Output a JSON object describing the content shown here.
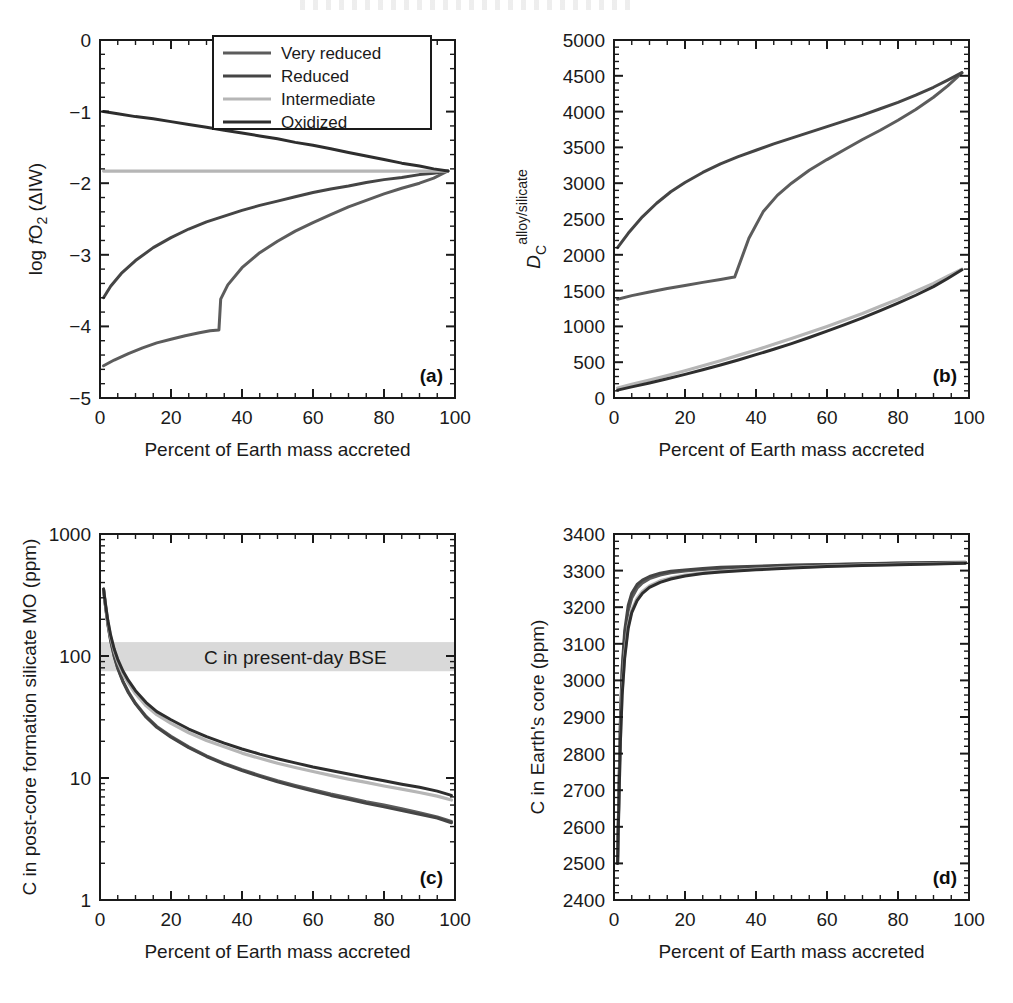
{
  "figure": {
    "panels": [
      "a",
      "b",
      "c",
      "d"
    ],
    "xlabel": "Percent of Earth mass accreted",
    "label_a": "(a)",
    "label_b": "(b)",
    "label_c": "(c)",
    "label_d": "(d)"
  },
  "legend": {
    "position": "top-right of panel a",
    "items": [
      {
        "label": "Very reduced",
        "color": "#5c5c5c"
      },
      {
        "label": "Reduced",
        "color": "#454545"
      },
      {
        "label": "Intermediate",
        "color": "#b6b6b6"
      },
      {
        "label": "Oxidized",
        "color": "#2e2e2e"
      }
    ]
  },
  "annotations": {
    "bse_band_label": "C in present-day BSE",
    "bse_band_color": "#d9d9d9",
    "bse_band_range": [
      75,
      130
    ]
  },
  "colors": {
    "very_reduced": "#5c5c5c",
    "reduced": "#454545",
    "intermediate": "#b6b6b6",
    "oxidized": "#2e2e2e",
    "axis": "#1a1a1a",
    "band": "#d9d9d9"
  },
  "chart_data": [
    {
      "id": "a",
      "type": "line",
      "title": "",
      "panel_label": "(a)",
      "xlabel": "Percent of Earth mass accreted",
      "ylabel": "log fO2 (ΔIW)",
      "ylabel_parts": {
        "pre": "log ",
        "italic": "f",
        "base": "O",
        "sub": "2",
        "post": " (ΔIW)"
      },
      "xlim": [
        0,
        100
      ],
      "ylim": [
        -5,
        0
      ],
      "xticks": [
        0,
        20,
        40,
        60,
        80,
        100
      ],
      "yticks": [
        0,
        -1,
        -2,
        -3,
        -4,
        -5
      ],
      "ytick_labels": [
        "0",
        "−1",
        "−2",
        "−3",
        "−4",
        "−5"
      ],
      "x_minor_step": 5,
      "y_minor_step": 0.2,
      "grid": false,
      "legend_position": "upper right",
      "series": [
        {
          "name": "Very reduced",
          "color": "#5c5c5c",
          "x": [
            1,
            4,
            8,
            12,
            16,
            20,
            24,
            28,
            31,
            33.5,
            34,
            36,
            40,
            45,
            50,
            55,
            60,
            65,
            70,
            75,
            80,
            85,
            90,
            94,
            98
          ],
          "y": [
            -4.55,
            -4.47,
            -4.38,
            -4.3,
            -4.23,
            -4.18,
            -4.13,
            -4.09,
            -4.06,
            -4.05,
            -3.62,
            -3.42,
            -3.18,
            -2.97,
            -2.81,
            -2.67,
            -2.55,
            -2.44,
            -2.33,
            -2.24,
            -2.15,
            -2.07,
            -2.0,
            -1.93,
            -1.83
          ]
        },
        {
          "name": "Reduced",
          "color": "#454545",
          "x": [
            1,
            3,
            6,
            10,
            15,
            20,
            25,
            30,
            35,
            40,
            45,
            50,
            55,
            60,
            65,
            70,
            75,
            80,
            85,
            90,
            94,
            98
          ],
          "y": [
            -3.6,
            -3.44,
            -3.26,
            -3.08,
            -2.9,
            -2.76,
            -2.64,
            -2.54,
            -2.46,
            -2.38,
            -2.31,
            -2.25,
            -2.19,
            -2.13,
            -2.08,
            -2.04,
            -1.99,
            -1.95,
            -1.92,
            -1.88,
            -1.86,
            -1.83
          ]
        },
        {
          "name": "Intermediate",
          "color": "#b6b6b6",
          "x": [
            1,
            20,
            40,
            60,
            80,
            98
          ],
          "y": [
            -1.83,
            -1.83,
            -1.83,
            -1.83,
            -1.83,
            -1.83
          ]
        },
        {
          "name": "Oxidized",
          "color": "#2e2e2e",
          "x": [
            1,
            5,
            10,
            15,
            20,
            25,
            30,
            35,
            40,
            45,
            50,
            55,
            60,
            65,
            70,
            75,
            80,
            85,
            90,
            94,
            98
          ],
          "y": [
            -1.0,
            -1.03,
            -1.07,
            -1.1,
            -1.14,
            -1.18,
            -1.22,
            -1.26,
            -1.3,
            -1.34,
            -1.38,
            -1.43,
            -1.47,
            -1.52,
            -1.57,
            -1.62,
            -1.67,
            -1.72,
            -1.76,
            -1.8,
            -1.83
          ]
        }
      ]
    },
    {
      "id": "b",
      "type": "line",
      "title": "",
      "panel_label": "(b)",
      "xlabel": "Percent of Earth mass accreted",
      "ylabel": "DC alloy/silicate",
      "ylabel_parts": {
        "italic": "D",
        "sub": "C",
        "sup": "alloy/silicate"
      },
      "xlim": [
        0,
        100
      ],
      "ylim": [
        0,
        5000
      ],
      "xticks": [
        0,
        20,
        40,
        60,
        80,
        100
      ],
      "yticks": [
        0,
        500,
        1000,
        1500,
        2000,
        2500,
        3000,
        3500,
        4000,
        4500,
        5000
      ],
      "x_minor_step": 5,
      "y_minor_step": 100,
      "grid": false,
      "series": [
        {
          "name": "Very reduced",
          "color": "#5c5c5c",
          "x": [
            1,
            5,
            10,
            15,
            20,
            25,
            30,
            33.5,
            34,
            38,
            42,
            46,
            50,
            55,
            60,
            65,
            70,
            75,
            80,
            85,
            90,
            94,
            98
          ],
          "y": [
            1380,
            1430,
            1480,
            1530,
            1570,
            1615,
            1655,
            1685,
            1690,
            2230,
            2600,
            2830,
            3000,
            3180,
            3330,
            3470,
            3610,
            3740,
            3880,
            4030,
            4200,
            4360,
            4540
          ]
        },
        {
          "name": "Reduced",
          "color": "#454545",
          "x": [
            1,
            4,
            8,
            12,
            16,
            20,
            25,
            30,
            35,
            40,
            45,
            50,
            55,
            60,
            65,
            70,
            75,
            80,
            85,
            90,
            94,
            98
          ],
          "y": [
            2100,
            2300,
            2530,
            2720,
            2880,
            3010,
            3150,
            3270,
            3370,
            3460,
            3550,
            3630,
            3710,
            3790,
            3870,
            3950,
            4040,
            4130,
            4230,
            4340,
            4440,
            4545
          ]
        },
        {
          "name": "Intermediate",
          "color": "#b6b6b6",
          "x": [
            1,
            5,
            10,
            15,
            20,
            25,
            30,
            35,
            40,
            45,
            50,
            55,
            60,
            65,
            70,
            75,
            80,
            85,
            90,
            94,
            98
          ],
          "y": [
            140,
            190,
            250,
            315,
            380,
            450,
            520,
            595,
            670,
            750,
            830,
            915,
            1000,
            1090,
            1180,
            1280,
            1380,
            1490,
            1600,
            1700,
            1800
          ]
        },
        {
          "name": "Oxidized",
          "color": "#2e2e2e",
          "x": [
            1,
            5,
            10,
            15,
            20,
            25,
            30,
            35,
            40,
            45,
            50,
            55,
            60,
            65,
            70,
            75,
            80,
            85,
            90,
            94,
            98
          ],
          "y": [
            110,
            155,
            210,
            270,
            330,
            395,
            460,
            530,
            605,
            680,
            760,
            845,
            935,
            1025,
            1120,
            1220,
            1325,
            1435,
            1555,
            1670,
            1790
          ]
        }
      ]
    },
    {
      "id": "c",
      "type": "line",
      "title": "",
      "panel_label": "(c)",
      "xlabel": "Percent of Earth mass accreted",
      "ylabel": "C in post-core formation silicate MO (ppm)",
      "xlim": [
        0,
        100
      ],
      "ylim": [
        1,
        1000
      ],
      "yscale": "log",
      "xticks": [
        0,
        20,
        40,
        60,
        80,
        100
      ],
      "yticks": [
        1,
        10,
        100,
        1000
      ],
      "ytick_labels": [
        "1",
        "10",
        "100",
        "1000"
      ],
      "x_minor_step": 5,
      "grid": false,
      "band": {
        "label": "C in present-day BSE",
        "ymin": 75,
        "ymax": 130,
        "color": "#d9d9d9"
      },
      "series": [
        {
          "name": "Very reduced",
          "color": "#5c5c5c",
          "x": [
            1,
            1.6,
            2.2,
            3,
            4,
            5,
            6.5,
            8,
            10,
            13,
            16,
            20,
            25,
            30,
            35,
            40,
            45,
            50,
            55,
            60,
            65,
            70,
            75,
            80,
            85,
            90,
            95,
            99
          ],
          "y": [
            350,
            250,
            185,
            135,
            100,
            80,
            62,
            51,
            41,
            32,
            26.5,
            22,
            18,
            15.2,
            13.2,
            11.7,
            10.5,
            9.5,
            8.7,
            8.0,
            7.4,
            6.9,
            6.4,
            6.0,
            5.6,
            5.2,
            4.8,
            4.4
          ]
        },
        {
          "name": "Reduced",
          "color": "#454545",
          "x": [
            1,
            1.6,
            2.2,
            3,
            4,
            5,
            6.5,
            8,
            10,
            13,
            16,
            20,
            25,
            30,
            35,
            40,
            45,
            50,
            55,
            60,
            65,
            70,
            75,
            80,
            85,
            90,
            95,
            99
          ],
          "y": [
            348,
            248,
            183,
            133,
            99,
            79,
            61,
            50,
            40.5,
            31.5,
            26,
            21.6,
            17.7,
            15.0,
            13.0,
            11.5,
            10.3,
            9.3,
            8.5,
            7.8,
            7.2,
            6.7,
            6.2,
            5.8,
            5.4,
            5.05,
            4.7,
            4.3
          ]
        },
        {
          "name": "Intermediate",
          "color": "#b6b6b6",
          "x": [
            1,
            1.6,
            2.2,
            3,
            4,
            5,
            6.5,
            8,
            10,
            13,
            16,
            20,
            25,
            30,
            35,
            40,
            45,
            50,
            55,
            60,
            65,
            70,
            75,
            80,
            85,
            90,
            95,
            99
          ],
          "y": [
            352,
            255,
            192,
            143,
            110,
            90,
            71,
            60,
            49,
            39,
            33,
            28,
            23.5,
            20.3,
            18.0,
            16.0,
            14.5,
            13.2,
            12.2,
            11.3,
            10.5,
            9.8,
            9.2,
            8.6,
            8.1,
            7.6,
            7.1,
            6.6
          ]
        },
        {
          "name": "Oxidized",
          "color": "#2e2e2e",
          "x": [
            1,
            1.6,
            2.2,
            3,
            4,
            5,
            6.5,
            8,
            10,
            13,
            16,
            20,
            25,
            30,
            35,
            40,
            45,
            50,
            55,
            60,
            65,
            70,
            75,
            80,
            85,
            90,
            95,
            99
          ],
          "y": [
            355,
            260,
            196,
            148,
            114,
            94,
            75,
            63,
            52,
            41.5,
            35,
            30,
            25.2,
            21.8,
            19.3,
            17.3,
            15.7,
            14.4,
            13.3,
            12.3,
            11.5,
            10.8,
            10.1,
            9.5,
            8.9,
            8.4,
            7.8,
            7.2
          ]
        }
      ]
    },
    {
      "id": "d",
      "type": "line",
      "title": "",
      "panel_label": "(d)",
      "xlabel": "Percent of Earth mass accreted",
      "ylabel": "C in Earth's core (ppm)",
      "xlim": [
        0,
        100
      ],
      "ylim": [
        2400,
        3400
      ],
      "xticks": [
        0,
        20,
        40,
        60,
        80,
        100
      ],
      "yticks": [
        2400,
        2500,
        2600,
        2700,
        2800,
        2900,
        3000,
        3100,
        3200,
        3300,
        3400
      ],
      "x_minor_step": 5,
      "y_minor_step": 20,
      "grid": false,
      "series": [
        {
          "name": "Very reduced",
          "color": "#5c5c5c",
          "x": [
            1,
            1.4,
            1.8,
            2.3,
            3,
            4,
            5,
            6.5,
            8,
            10,
            13,
            16,
            20,
            25,
            30,
            40,
            50,
            60,
            70,
            80,
            90,
            99
          ],
          "y": [
            2500,
            2700,
            2880,
            3020,
            3120,
            3190,
            3225,
            3252,
            3266,
            3278,
            3288,
            3294,
            3299,
            3303,
            3306,
            3310,
            3313,
            3316,
            3318,
            3320,
            3321,
            3322
          ]
        },
        {
          "name": "Reduced",
          "color": "#454545",
          "x": [
            1,
            1.4,
            1.8,
            2.3,
            3,
            4,
            5,
            6.5,
            8,
            10,
            13,
            16,
            20,
            25,
            30,
            40,
            50,
            60,
            70,
            80,
            90,
            99
          ],
          "y": [
            2500,
            2705,
            2890,
            3035,
            3135,
            3205,
            3238,
            3262,
            3274,
            3284,
            3293,
            3298,
            3302,
            3306,
            3309,
            3312,
            3315,
            3317,
            3319,
            3321,
            3322,
            3323
          ]
        },
        {
          "name": "Intermediate",
          "color": "#b6b6b6",
          "x": [
            1,
            1.4,
            1.8,
            2.3,
            3,
            4,
            5,
            6.5,
            8,
            10,
            13,
            16,
            20,
            25,
            30,
            40,
            50,
            60,
            70,
            80,
            90,
            99
          ],
          "y": [
            2500,
            2680,
            2840,
            2970,
            3070,
            3150,
            3192,
            3224,
            3243,
            3258,
            3272,
            3280,
            3288,
            3294,
            3298,
            3304,
            3309,
            3312,
            3315,
            3317,
            3319,
            3321
          ]
        },
        {
          "name": "Oxidized",
          "color": "#2e2e2e",
          "x": [
            1,
            1.4,
            1.8,
            2.3,
            3,
            4,
            5,
            6.5,
            8,
            10,
            13,
            16,
            20,
            25,
            30,
            40,
            50,
            60,
            70,
            80,
            90,
            99
          ],
          "y": [
            2500,
            2675,
            2832,
            2960,
            3060,
            3142,
            3185,
            3218,
            3238,
            3254,
            3268,
            3277,
            3285,
            3292,
            3296,
            3302,
            3307,
            3311,
            3314,
            3316,
            3318,
            3320
          ]
        }
      ]
    }
  ]
}
